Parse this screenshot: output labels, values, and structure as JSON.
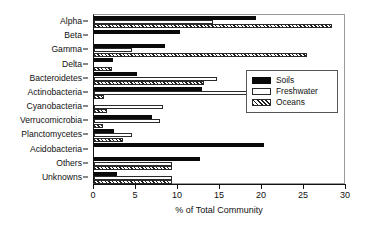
{
  "chart_data": {
    "type": "bar",
    "orientation": "horizontal",
    "title": "",
    "xlabel": "% of Total Community",
    "ylabel": "",
    "xlim": [
      0,
      30
    ],
    "xticks": [
      0,
      5,
      10,
      15,
      20,
      25,
      30
    ],
    "xticklabels": [
      "0",
      "5",
      "10",
      "15",
      "20",
      "25",
      "30"
    ],
    "grid": false,
    "legend_position": "center-right",
    "categories": [
      "Alpha",
      "Beta",
      "Gamma",
      "Delta",
      "Bacteroidetes",
      "Actinobacteria",
      "Cyanobacteria",
      "Verrucomicrobia",
      "Planctomycetes",
      "Acidobacteria",
      "Others",
      "Unknowns"
    ],
    "series": [
      {
        "name": "Soils",
        "fill": "solid-black",
        "values": [
          19.3,
          10.2,
          8.5,
          2.3,
          5.1,
          12.9,
          0.0,
          6.9,
          2.4,
          20.2,
          12.6,
          2.7
        ]
      },
      {
        "name": "Freshwater",
        "fill": "open-white",
        "values": [
          14.2,
          0.0,
          4.5,
          0.0,
          14.6,
          19.3,
          8.2,
          7.9,
          4.5,
          0.0,
          9.3,
          9.3
        ]
      },
      {
        "name": "Oceans",
        "fill": "diagonal-hatch",
        "values": [
          28.3,
          0.0,
          25.4,
          2.1,
          13.1,
          1.2,
          1.5,
          1.1,
          3.5,
          0.0,
          9.3,
          9.3
        ]
      }
    ]
  },
  "legend": {
    "entries": [
      {
        "label": "Soils",
        "swatch": "solid-black-swatch"
      },
      {
        "label": "Freshwater",
        "swatch": "open-white-swatch"
      },
      {
        "label": "Oceans",
        "swatch": "diagonal-hatch-swatch"
      }
    ]
  }
}
